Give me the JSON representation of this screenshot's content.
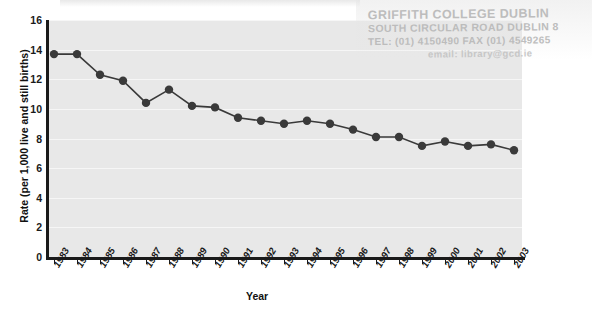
{
  "chart_data": {
    "type": "line",
    "title": "",
    "xlabel": "Year",
    "ylabel": "Rate (per 1,000 live and still births)",
    "ylim": [
      0,
      16
    ],
    "ytick_step": 2,
    "yticks": [
      16,
      14,
      12,
      10,
      8,
      6,
      4,
      2,
      0
    ],
    "grid": true,
    "grid_axis": "y",
    "legend": "none",
    "marker": "circle",
    "series_color": "#3a3a3a",
    "plot_background": "#e8e8e8",
    "categories": [
      "1983",
      "1984",
      "1985",
      "1986",
      "1987",
      "1988",
      "1989",
      "1990",
      "1991",
      "1992",
      "1993",
      "1994",
      "1995",
      "1996",
      "1997",
      "1998",
      "1999",
      "2000",
      "2001",
      "2002",
      "2003"
    ],
    "values": [
      13.7,
      13.7,
      12.3,
      11.9,
      10.4,
      11.3,
      10.2,
      10.1,
      9.4,
      9.2,
      9.0,
      9.2,
      9.0,
      8.6,
      8.1,
      8.1,
      7.5,
      7.8,
      7.5,
      7.6,
      7.2
    ]
  },
  "axes": {
    "ylabel": "Rate (per 1,000 live and still births)",
    "xlabel": "Year"
  },
  "stamp": {
    "line1": "GRIFFITH COLLEGE DUBLIN",
    "line2": "SOUTH CIRCULAR ROAD DUBLIN 8",
    "line3": "TEL: (01) 4150490  FAX (01) 4549265",
    "line4": "email: library@gcd.ie"
  }
}
